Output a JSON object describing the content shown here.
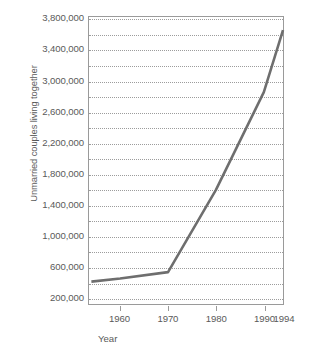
{
  "chart_data": {
    "type": "line",
    "title": "",
    "xlabel": "Year",
    "ylabel": "Unmarried couples living together",
    "xlim": [
      1953.5,
      1994
    ],
    "ylim": [
      110000,
      3830000
    ],
    "grid": true,
    "grid_style": "dotted horizontal",
    "legend": "none",
    "y_tick_labels": [
      "3,800,000",
      "3,400,000",
      "3,000,000",
      "2,600,000",
      "2,200,000",
      "1,800,000",
      "1,400,000",
      "1,000,000",
      "600,000",
      "200,000"
    ],
    "y_tick_values": [
      3800000,
      3400000,
      3000000,
      2600000,
      2200000,
      1800000,
      1400000,
      1000000,
      600000,
      200000
    ],
    "y_minor_interval": 200000,
    "x_tick_labels": [
      "1960",
      "1970",
      "1980",
      "1990",
      "1994"
    ],
    "x_tick_values": [
      1960,
      1970,
      1980,
      1990,
      1994
    ],
    "series": [
      {
        "name": "Unmarried couples living together",
        "color": "#6e6e6e",
        "x": [
          1954,
          1960,
          1970,
          1980,
          1990,
          1994
        ],
        "values": [
          400000,
          440000,
          523000,
          1589000,
          2856000,
          3661000
        ]
      }
    ]
  },
  "axes": {
    "y_title": "Unmarried couples living together",
    "x_title": "Year"
  },
  "colors": {
    "line": "#6e6e6e",
    "axis": "#9a9a9a",
    "grid": "#9c9c9c",
    "text": "#5a5a5a",
    "background": "#ffffff"
  }
}
